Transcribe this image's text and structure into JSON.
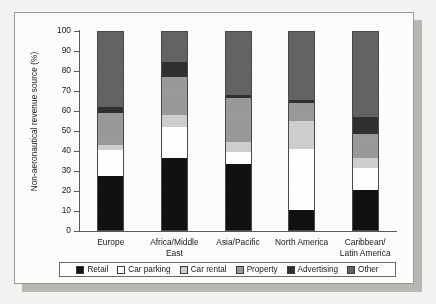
{
  "chart_data": {
    "type": "bar",
    "subtype": "stacked-bar-100-percent",
    "title": "",
    "xlabel": "",
    "ylabel": "Non-aeronautical revenue source (%)",
    "ylim": [
      0,
      100
    ],
    "ytick_labels": [
      "100",
      "90",
      "80",
      "70",
      "60",
      "50",
      "40",
      "30",
      "20",
      "10",
      "0"
    ],
    "ytick_values": [
      100,
      90,
      80,
      70,
      60,
      50,
      40,
      30,
      20,
      10,
      0
    ],
    "grid": false,
    "legend_position": "bottom",
    "categories": [
      "Europe",
      "Africa/Middle East",
      "Asia/Pacific",
      "North America",
      "Caribbean/\nLatin America"
    ],
    "category_labels": [
      {
        "line1": "Europe",
        "line2": ""
      },
      {
        "line1": "Africa/Middle East",
        "line2": ""
      },
      {
        "line1": "Asia/Pacific",
        "line2": ""
      },
      {
        "line1": "North America",
        "line2": ""
      },
      {
        "line1": "Caribbean/",
        "line2": "Latin America"
      }
    ],
    "series": [
      {
        "name": "Retail",
        "color": "#111111",
        "values": [
          27.5,
          36.5,
          33.5,
          10.5,
          20.5
        ]
      },
      {
        "name": "Car parking",
        "color": "#ffffff",
        "values": [
          13.0,
          15.5,
          6.0,
          30.5,
          11.0
        ]
      },
      {
        "name": "Car rental",
        "color": "#cfcfcf",
        "values": [
          2.5,
          6.0,
          5.0,
          14.0,
          5.0
        ]
      },
      {
        "name": "Property",
        "color": "#9a9a9a",
        "values": [
          16.0,
          19.0,
          22.0,
          9.0,
          12.0
        ]
      },
      {
        "name": "Advertising",
        "color": "#2f2f2f",
        "values": [
          3.0,
          7.5,
          1.5,
          1.5,
          8.5
        ]
      },
      {
        "name": "Other",
        "color": "#636363",
        "values": [
          38.0,
          15.5,
          32.0,
          34.5,
          43.0
        ]
      }
    ],
    "legend_entries": [
      {
        "label": "Retail",
        "color": "#111111"
      },
      {
        "label": "Car parking",
        "color": "#ffffff"
      },
      {
        "label": "Car rental",
        "color": "#cfcfcf"
      },
      {
        "label": "Property",
        "color": "#9a9a9a"
      },
      {
        "label": "Advertising",
        "color": "#2f2f2f"
      },
      {
        "label": "Other",
        "color": "#636363"
      }
    ]
  }
}
